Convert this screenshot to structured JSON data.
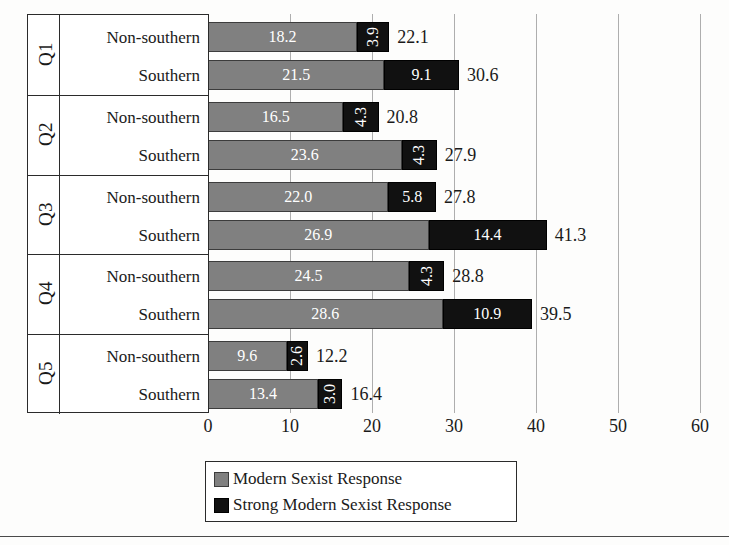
{
  "chart_data": {
    "type": "bar",
    "orientation": "horizontal",
    "stacked": true,
    "title": "",
    "xlabel": "",
    "ylabel": "",
    "xlim": [
      0,
      60
    ],
    "xticks": [
      0,
      10,
      20,
      30,
      40,
      50,
      60
    ],
    "grid": true,
    "legend_position": "bottom",
    "series": [
      {
        "name": "Modern Sexist Response",
        "color": "#808080",
        "values": [
          18.2,
          21.5,
          16.5,
          23.6,
          22.0,
          26.9,
          24.5,
          28.6,
          9.6,
          13.4
        ]
      },
      {
        "name": "Strong Modern Sexist Response",
        "color": "#111111",
        "values": [
          3.9,
          9.1,
          4.3,
          4.3,
          5.8,
          14.4,
          4.3,
          10.9,
          2.6,
          3.0
        ]
      }
    ],
    "categories": [
      "Q1 Non-southern",
      "Q1 Southern",
      "Q2 Non-southern",
      "Q2 Southern",
      "Q3 Non-southern",
      "Q3 Southern",
      "Q4 Non-southern",
      "Q4 Southern",
      "Q5 Non-southern",
      "Q5 Southern"
    ],
    "totals": [
      22.1,
      30.6,
      20.8,
      27.9,
      27.8,
      41.3,
      28.8,
      39.5,
      12.2,
      16.4
    ]
  },
  "groups": [
    {
      "group_label": "Q1",
      "rows": [
        {
          "row_label": "Non-southern",
          "modern": "18.2",
          "strong": "3.9",
          "total": "22.1"
        },
        {
          "row_label": "Southern",
          "modern": "21.5",
          "strong": "9.1",
          "total": "30.6"
        }
      ]
    },
    {
      "group_label": "Q2",
      "rows": [
        {
          "row_label": "Non-southern",
          "modern": "16.5",
          "strong": "4.3",
          "total": "20.8"
        },
        {
          "row_label": "Southern",
          "modern": "23.6",
          "strong": "4.3",
          "total": "27.9"
        }
      ]
    },
    {
      "group_label": "Q3",
      "rows": [
        {
          "row_label": "Non-southern",
          "modern": "22.0",
          "strong": "5.8",
          "total": "27.8"
        },
        {
          "row_label": "Southern",
          "modern": "26.9",
          "strong": "14.4",
          "total": "41.3"
        }
      ]
    },
    {
      "group_label": "Q4",
      "rows": [
        {
          "row_label": "Non-southern",
          "modern": "24.5",
          "strong": "4.3",
          "total": "28.8"
        },
        {
          "row_label": "Southern",
          "modern": "28.6",
          "strong": "10.9",
          "total": "39.5"
        }
      ]
    },
    {
      "group_label": "Q5",
      "rows": [
        {
          "row_label": "Non-southern",
          "modern": "9.6",
          "strong": "2.6",
          "total": "12.2"
        },
        {
          "row_label": "Southern",
          "modern": "13.4",
          "strong": "3.0",
          "total": "16.4"
        }
      ]
    }
  ],
  "axis": {
    "ticks": [
      "0",
      "10",
      "20",
      "30",
      "40",
      "50",
      "60"
    ]
  },
  "legend": {
    "items": [
      {
        "label": "Modern Sexist Response",
        "color": "#808080"
      },
      {
        "label": "Strong Modern Sexist Response",
        "color": "#111111"
      }
    ]
  }
}
